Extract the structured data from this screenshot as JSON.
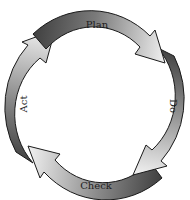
{
  "diagram": {
    "type": "cycle",
    "direction": "clockwise",
    "stages": [
      {
        "label": "Plan",
        "position": "top"
      },
      {
        "label": "Do",
        "position": "right"
      },
      {
        "label": "Check",
        "position": "bottom"
      },
      {
        "label": "Act",
        "position": "left"
      }
    ],
    "colors": {
      "arrow_tail": "#4a4a4a",
      "arrow_head": "#f2f2f2",
      "outline": "#1a1a1a",
      "text": "#1e1e1e",
      "background": "#ffffff"
    }
  }
}
